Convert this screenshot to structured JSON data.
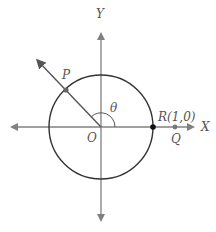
{
  "diagram": {
    "axes": {
      "x_label": "X",
      "y_label": "Y"
    },
    "points": {
      "origin": "O",
      "p": "P",
      "r": "R(1,0)",
      "q": "Q"
    },
    "angle_label": "θ",
    "colors": {
      "axis": "#808080",
      "circle": "#333333",
      "ray": "#555555",
      "point_r": "#111111",
      "point_pq": "#666666"
    }
  }
}
